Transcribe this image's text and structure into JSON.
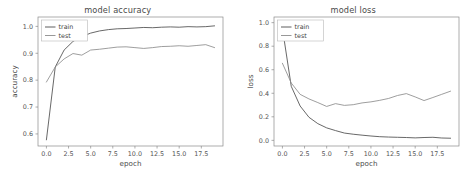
{
  "figure": {
    "background": "#ffffff",
    "panel_count": 2
  },
  "chart_data": [
    {
      "type": "line",
      "title": "model accuracy",
      "xlabel": "epoch",
      "ylabel": "accuracy",
      "xlim": [
        -0.95,
        19.95
      ],
      "ylim": [
        0.5551,
        1.0349
      ],
      "xticks": [
        0.0,
        2.5,
        5.0,
        7.5,
        10.0,
        12.5,
        15.0,
        17.5
      ],
      "xticklabels": [
        "0.0",
        "2.5",
        "5.0",
        "7.5",
        "10.0",
        "12.5",
        "15.0",
        "17.5"
      ],
      "yticks": [
        0.6,
        0.7,
        0.8,
        0.9,
        1.0
      ],
      "yticklabels": [
        "0.6",
        "0.7",
        "0.8",
        "0.9",
        "1.0"
      ],
      "grid": false,
      "legend_position": "upper left",
      "legend_entries": [
        "train",
        "test"
      ],
      "x": [
        0,
        1,
        2,
        3,
        4,
        5,
        6,
        7,
        8,
        9,
        10,
        11,
        12,
        13,
        14,
        15,
        16,
        17,
        18,
        19
      ],
      "series": [
        {
          "name": "train",
          "color": "#4d4d4d",
          "values": [
            0.578,
            0.849,
            0.912,
            0.944,
            0.962,
            0.975,
            0.983,
            0.988,
            0.991,
            0.992,
            0.994,
            0.996,
            0.995,
            0.997,
            0.998,
            0.997,
            0.999,
            0.998,
            0.999,
            1.002
          ]
        },
        {
          "name": "test",
          "color": "#8c8c8c",
          "values": [
            0.793,
            0.849,
            0.879,
            0.899,
            0.893,
            0.912,
            0.915,
            0.919,
            0.923,
            0.924,
            0.921,
            0.918,
            0.921,
            0.925,
            0.926,
            0.928,
            0.926,
            0.929,
            0.932,
            0.921
          ]
        }
      ]
    },
    {
      "type": "line",
      "title": "model loss",
      "xlabel": "epoch",
      "ylabel": "loss",
      "xlim": [
        -0.95,
        19.95
      ],
      "ylim": [
        -0.048,
        1.048
      ],
      "xticks": [
        0.0,
        2.5,
        5.0,
        7.5,
        10.0,
        12.5,
        15.0,
        17.5
      ],
      "xticklabels": [
        "0.0",
        "2.5",
        "5.0",
        "7.5",
        "10.0",
        "12.5",
        "15.0",
        "17.5"
      ],
      "yticks": [
        0.0,
        0.2,
        0.4,
        0.6,
        0.8,
        1.0
      ],
      "yticklabels": [
        "0.0",
        "0.2",
        "0.4",
        "0.6",
        "0.8",
        "1.0"
      ],
      "grid": false,
      "legend_position": "upper left",
      "legend_entries": [
        "train",
        "test"
      ],
      "x": [
        0,
        1,
        2,
        3,
        4,
        5,
        6,
        7,
        8,
        9,
        10,
        11,
        12,
        13,
        14,
        15,
        16,
        17,
        18,
        19
      ],
      "series": [
        {
          "name": "train",
          "color": "#4d4d4d",
          "values": [
            0.952,
            0.459,
            0.292,
            0.196,
            0.142,
            0.106,
            0.083,
            0.062,
            0.052,
            0.044,
            0.037,
            0.031,
            0.028,
            0.026,
            0.024,
            0.021,
            0.024,
            0.026,
            0.02,
            0.018
          ]
        },
        {
          "name": "test",
          "color": "#8c8c8c",
          "values": [
            0.655,
            0.487,
            0.391,
            0.352,
            0.321,
            0.288,
            0.312,
            0.297,
            0.303,
            0.318,
            0.327,
            0.34,
            0.356,
            0.381,
            0.397,
            0.369,
            0.338,
            0.364,
            0.391,
            0.418
          ]
        }
      ]
    }
  ]
}
